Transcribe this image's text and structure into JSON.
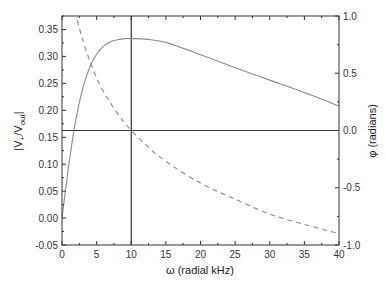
{
  "chart_data": {
    "type": "line",
    "title": "",
    "xlabel": "ω (radial kHz)",
    "ylabel_left": "|V+/Vout|",
    "ylabel_left_parts": {
      "main": "|V",
      "sub1": "+",
      "slash": "/V",
      "sub2": "out",
      "end": "|"
    },
    "ylabel_right": "φ (radians)",
    "xlim": [
      0,
      40
    ],
    "ylim_left": [
      -0.05,
      0.375
    ],
    "ylim_right": [
      -1.0,
      1.0
    ],
    "x_ticks": [
      0,
      5,
      10,
      15,
      20,
      25,
      30,
      35,
      40
    ],
    "x_tick_labels": [
      "0",
      "5",
      "10",
      "15",
      "20",
      "25",
      "30",
      "35",
      "40"
    ],
    "y_left_ticks": [
      -0.05,
      0.0,
      0.05,
      0.1,
      0.15,
      0.2,
      0.25,
      0.3,
      0.35
    ],
    "y_left_tick_labels": [
      "-0.05",
      "0.00",
      "0.05",
      "0.10",
      "0.15",
      "0.20",
      "0.25",
      "0.30",
      "0.35"
    ],
    "y_right_ticks": [
      -1.0,
      -0.5,
      0.0,
      0.5,
      1.0
    ],
    "y_right_tick_labels": [
      "-1.0",
      "-0.5",
      "0.0",
      "0.5",
      "1.0"
    ],
    "grid": false,
    "legend": null,
    "reference_lines": [
      {
        "orientation": "vertical",
        "x": 10,
        "note": "resonant frequency ω0"
      },
      {
        "orientation": "horizontal",
        "y_right": 0.0,
        "note": "zero phase"
      }
    ],
    "series": [
      {
        "name": "|V+/Vout| (magnitude)",
        "axis": "left",
        "style": "solid",
        "color": "#8a8a8a",
        "x": [
          0,
          1,
          2,
          3,
          4,
          5,
          6,
          7,
          8,
          9,
          10,
          12,
          15,
          20,
          25,
          30,
          35,
          40
        ],
        "values": [
          0.0,
          0.1,
          0.183,
          0.241,
          0.28,
          0.304,
          0.319,
          0.327,
          0.331,
          0.333,
          0.333,
          0.332,
          0.326,
          0.303,
          0.279,
          0.256,
          0.233,
          0.208
        ]
      },
      {
        "name": "φ (phase)",
        "axis": "right",
        "style": "dashed",
        "color": "#8a8a8a",
        "x": [
          1,
          2,
          3,
          4,
          5,
          6,
          7,
          8,
          9,
          10,
          12,
          15,
          20,
          25,
          30,
          35,
          40
        ],
        "values": [
          1.27,
          1.01,
          0.79,
          0.61,
          0.46,
          0.34,
          0.24,
          0.15,
          0.07,
          0.0,
          -0.12,
          -0.27,
          -0.46,
          -0.6,
          -0.73,
          -0.82,
          -0.9
        ]
      }
    ]
  }
}
